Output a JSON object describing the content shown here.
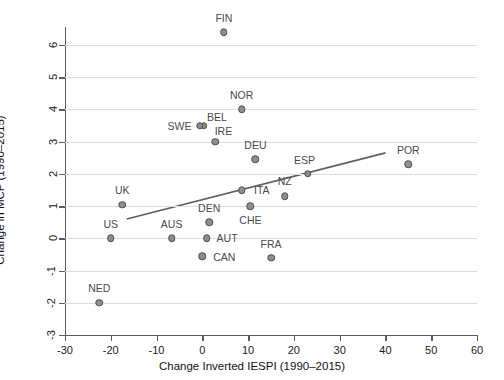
{
  "chart_data": {
    "type": "scatter",
    "title": "",
    "xlabel": "Change Inverted IESPI (1990–2015)",
    "ylabel": "Change in MCP (1990–2015)",
    "xlim": [
      -30,
      60
    ],
    "ylim": [
      -3,
      6
    ],
    "xticks": [
      -30,
      -20,
      -10,
      0,
      10,
      20,
      30,
      40,
      50,
      60
    ],
    "yticks": [
      -3,
      -2,
      -1,
      0,
      1,
      2,
      3,
      4,
      5,
      6
    ],
    "xticklabels": [
      "-30",
      "-20",
      "-10",
      "0",
      "10",
      "20",
      "30",
      "40",
      "50",
      "60"
    ],
    "yticklabels": [
      "-3",
      "-2",
      "-1",
      "0",
      "1",
      "2",
      "3",
      "4",
      "5",
      "6"
    ],
    "grid": "horizontal",
    "legend": "none",
    "point_color": "#8e8e8e",
    "point_edge_color": "#4c4c4c",
    "line_color": "#5a6068",
    "grid_color": "#d9dde1",
    "points": [
      {
        "label": "FIN",
        "x": 4.7,
        "y": 6.4,
        "lx": 4.7,
        "ly": 6.85
      },
      {
        "label": "NOR",
        "x": 8.6,
        "y": 4.0,
        "lx": 8.6,
        "ly": 4.45
      },
      {
        "label": "BEL",
        "x": 0.3,
        "y": 3.5,
        "lx": 3.2,
        "ly": 3.78
      },
      {
        "label": "SWE",
        "x": -0.6,
        "y": 3.5,
        "lx": -5.0,
        "ly": 3.5
      },
      {
        "label": "IRE",
        "x": 2.8,
        "y": 3.0,
        "lx": 4.6,
        "ly": 3.32
      },
      {
        "label": "DEU",
        "x": 11.6,
        "y": 2.45,
        "lx": 11.6,
        "ly": 2.9
      },
      {
        "label": "POR",
        "x": 45.0,
        "y": 2.3,
        "lx": 45.0,
        "ly": 2.75
      },
      {
        "label": "ESP",
        "x": 23.0,
        "y": 2.0,
        "lx": 22.3,
        "ly": 2.42
      },
      {
        "label": "ITA",
        "x": 8.6,
        "y": 1.5,
        "lx": 13.0,
        "ly": 1.5
      },
      {
        "label": "NZ",
        "x": 18.0,
        "y": 1.3,
        "lx": 18.0,
        "ly": 1.78
      },
      {
        "label": "UK",
        "x": -17.5,
        "y": 1.05,
        "lx": -17.5,
        "ly": 1.5
      },
      {
        "label": "CHE",
        "x": 10.5,
        "y": 1.0,
        "lx": 10.5,
        "ly": 0.58
      },
      {
        "label": "DEN",
        "x": 1.5,
        "y": 0.5,
        "lx": 1.5,
        "ly": 0.95
      },
      {
        "label": "US",
        "x": -20.0,
        "y": 0.0,
        "lx": -20.0,
        "ly": 0.45
      },
      {
        "label": "AUS",
        "x": -6.7,
        "y": 0.0,
        "lx": -6.7,
        "ly": 0.45
      },
      {
        "label": "AUT",
        "x": 1.0,
        "y": 0.0,
        "lx": 5.4,
        "ly": 0.0
      },
      {
        "label": "CAN",
        "x": 0.0,
        "y": -0.55,
        "lx": 4.8,
        "ly": -0.58
      },
      {
        "label": "FRA",
        "x": 15.0,
        "y": -0.6,
        "lx": 15.0,
        "ly": -0.17
      },
      {
        "label": "NED",
        "x": -22.5,
        "y": -2.0,
        "lx": -22.5,
        "ly": -1.55
      }
    ],
    "trendline": {
      "x0": -16.5,
      "y0": 0.6,
      "x1": 40.0,
      "y1": 2.65
    }
  }
}
